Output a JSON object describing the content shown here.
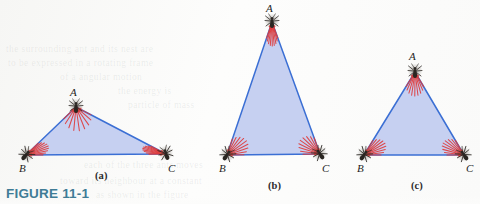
{
  "figure": {
    "caption": "FIGURE 11-1",
    "caption_color": "#3f7c96",
    "background_color": "#fdfdfc"
  },
  "style": {
    "triangle_fill": "#c3cdf0",
    "triangle_stroke": "#3b6fd4",
    "ray_color": "#e03a3a",
    "ant_color": "#2a2622",
    "label_color": "#1e1e1e"
  },
  "panels": [
    {
      "id": "a",
      "label": "(a)",
      "label_x": 95,
      "label_y": 170,
      "shape": "obtuse-flat-triangle",
      "vertices": [
        {
          "name": "A",
          "x": 76,
          "y": 107,
          "label_x": 70,
          "label_y": 96,
          "ant_rotation": 0
        },
        {
          "name": "B",
          "x": 26,
          "y": 155,
          "label_x": 19,
          "label_y": 172,
          "ant_rotation": 40
        },
        {
          "name": "C",
          "x": 166,
          "y": 154,
          "label_x": 168,
          "label_y": 172,
          "ant_rotation": -20
        }
      ]
    },
    {
      "id": "b",
      "label": "(b)",
      "label_x": 268,
      "label_y": 180,
      "shape": "tall-narrow-isosceles-triangle",
      "vertices": [
        {
          "name": "A",
          "x": 272,
          "y": 22,
          "label_x": 266,
          "label_y": 12,
          "ant_rotation": 0
        },
        {
          "name": "B",
          "x": 227,
          "y": 155,
          "label_x": 219,
          "label_y": 172,
          "ant_rotation": 35
        },
        {
          "name": "C",
          "x": 320,
          "y": 154,
          "label_x": 322,
          "label_y": 172,
          "ant_rotation": -35
        }
      ]
    },
    {
      "id": "c",
      "label": "(c)",
      "label_x": 411,
      "label_y": 180,
      "shape": "equilateral-triangle",
      "vertices": [
        {
          "name": "A",
          "x": 415,
          "y": 72,
          "label_x": 409,
          "label_y": 60,
          "ant_rotation": 0
        },
        {
          "name": "B",
          "x": 364,
          "y": 155,
          "label_x": 357,
          "label_y": 172,
          "ant_rotation": 35
        },
        {
          "name": "C",
          "x": 464,
          "y": 155,
          "label_x": 466,
          "label_y": 172,
          "ant_rotation": -35
        }
      ]
    }
  ],
  "ghost_text": [
    {
      "text": "the  surrounding  ant  and  its  nest  are",
      "x": 6,
      "y": 44
    },
    {
      "text": "to  be  expressed  in  a  rotating  frame",
      "x": 8,
      "y": 58
    },
    {
      "text": "of  a   angular  motion",
      "x": 60,
      "y": 72
    },
    {
      "text": "the  energy  is",
      "x": 118,
      "y": 86
    },
    {
      "text": "particle  of  mass",
      "x": 128,
      "y": 100
    },
    {
      "text": "each  of  the  three  ants  moves",
      "x": 84,
      "y": 160
    },
    {
      "text": "toward  its  neighbour  at  a  constant",
      "x": 60,
      "y": 176
    },
    {
      "text": "as  shown  in  the  figure",
      "x": 96,
      "y": 190
    }
  ]
}
